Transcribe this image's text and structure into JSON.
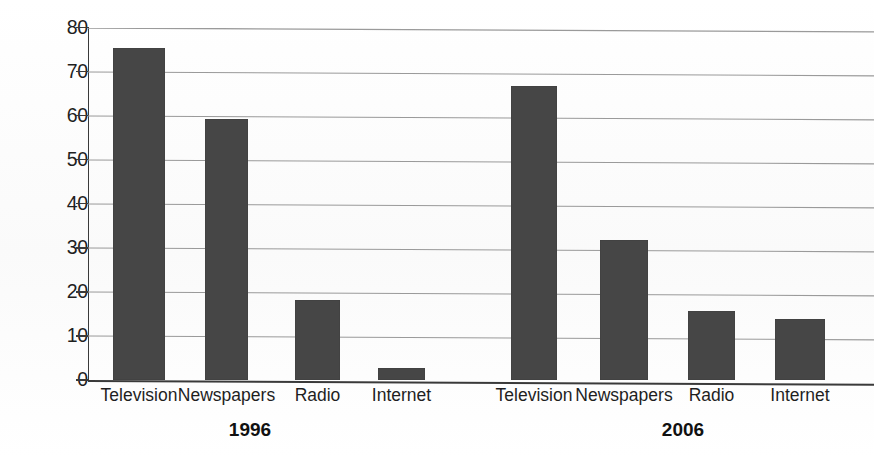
{
  "chart_data": {
    "type": "bar",
    "title": "",
    "subtitle": "",
    "xlabel": "",
    "ylabel": "Percent",
    "ylim": [
      0,
      80
    ],
    "yticks": [
      0,
      10,
      20,
      30,
      40,
      50,
      60,
      70,
      80
    ],
    "grid": true,
    "legend": "none",
    "categories": [
      "Television",
      "Newspapers",
      "Radio",
      "Internet"
    ],
    "panels": [
      {
        "label": "1996",
        "categories": [
          "Television",
          "Newspapers",
          "Radio",
          "Internet"
        ],
        "values": [
          75.3,
          59.3,
          18.1,
          2.7
        ]
      },
      {
        "label": "2006",
        "categories": [
          "Television",
          "Newspapers",
          "Radio",
          "Internet"
        ],
        "values": [
          66.8,
          31.8,
          15.6,
          13.9
        ]
      }
    ],
    "series": [
      {
        "name": "1996",
        "values": [
          75.3,
          59.3,
          18.1,
          2.7
        ]
      },
      {
        "name": "2006",
        "values": [
          66.8,
          31.8,
          15.6,
          13.9
        ]
      }
    ],
    "colors": {
      "bar": "#464646",
      "axis": "#3a3a3a",
      "gridline": "#9a9a9a",
      "background": "#ffffff",
      "text": "#1f1f1f"
    }
  },
  "axis": {
    "y_title": "Percent",
    "y_ticks": [
      "0",
      "10",
      "20",
      "30",
      "40",
      "50",
      "60",
      "70",
      "80"
    ]
  },
  "panels": {
    "first": {
      "year": "1996",
      "cats": [
        "Television",
        "Newspapers",
        "Radio",
        "Internet"
      ]
    },
    "second": {
      "year": "2006",
      "cats": [
        "Television",
        "Newspapers",
        "Radio",
        "Internet"
      ]
    }
  }
}
